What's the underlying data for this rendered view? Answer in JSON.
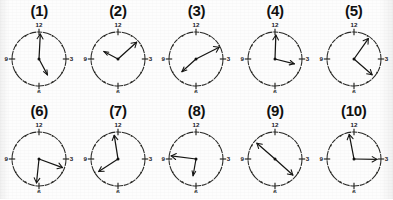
{
  "figure": {
    "layout": {
      "columns": 5,
      "rows": 2,
      "total": 10
    },
    "face": {
      "numerals": [
        "12",
        "3",
        "6",
        "9"
      ],
      "tick_count": 12,
      "style": "scanned line art, dotted minor ticks, dashed rim"
    },
    "colors": {
      "background": "#fdfdfd",
      "ink": "#1a1a1a",
      "rim": "#2a2a28",
      "hand": "#151513"
    }
  },
  "clocks": [
    {
      "label": "(1)",
      "name": "clock-1",
      "long_hand_deg": 3,
      "short_hand_deg": 152,
      "long_hand_len": 25,
      "short_hand_len": 18,
      "reads": "long hand near 12, short hand near 5"
    },
    {
      "label": "(2)",
      "name": "clock-2",
      "long_hand_deg": 48,
      "short_hand_deg": 298,
      "long_hand_len": 25,
      "short_hand_len": 16,
      "reads": "long hand near 1-2, short hand near 10"
    },
    {
      "label": "(3)",
      "name": "clock-3",
      "long_hand_deg": 63,
      "short_hand_deg": 228,
      "long_hand_len": 26,
      "short_hand_len": 19,
      "reads": "long hand near 2, short hand near 7-8"
    },
    {
      "label": "(4)",
      "name": "clock-4",
      "long_hand_deg": 2,
      "short_hand_deg": 104,
      "long_hand_len": 24,
      "short_hand_len": 20,
      "reads": "long hand at 12, short hand near 3-4"
    },
    {
      "label": "(5)",
      "name": "clock-5",
      "long_hand_deg": 35,
      "short_hand_deg": 131,
      "long_hand_len": 25,
      "short_hand_len": 24,
      "reads": "long hand near 1, short hand near 4"
    },
    {
      "label": "(6)",
      "name": "clock-6",
      "long_hand_deg": 110,
      "short_hand_deg": 186,
      "long_hand_len": 25,
      "short_hand_len": 24,
      "reads": "long hand near 3-4, short hand near 6"
    },
    {
      "label": "(7)",
      "name": "clock-7",
      "long_hand_deg": 351,
      "short_hand_deg": 237,
      "long_hand_len": 24,
      "short_hand_len": 23,
      "reads": "long hand near 12, short hand near 8"
    },
    {
      "label": "(8)",
      "name": "clock-8",
      "long_hand_deg": 277,
      "short_hand_deg": 190,
      "long_hand_len": 25,
      "short_hand_len": 17,
      "reads": "long hand near 9, short hand near 6"
    },
    {
      "label": "(9)",
      "name": "clock-9",
      "long_hand_deg": 311,
      "short_hand_deg": 132,
      "long_hand_len": 24,
      "short_hand_len": 24,
      "reads": "hands opposite, near 10 and near 4"
    },
    {
      "label": "(10)",
      "name": "clock-10",
      "long_hand_deg": 349,
      "short_hand_deg": 91,
      "long_hand_len": 25,
      "short_hand_len": 23,
      "reads": "long hand near 12, short hand at 3"
    }
  ]
}
